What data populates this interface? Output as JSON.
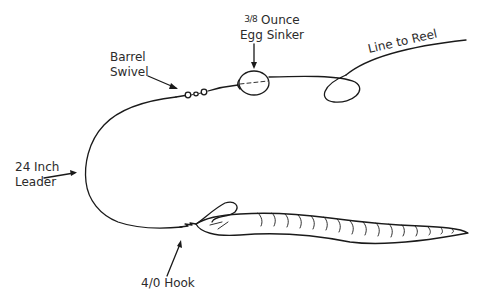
{
  "diagram": {
    "colors": {
      "line": "#1a1a1a",
      "text": "#2b2b2b",
      "background": "#ffffff"
    },
    "labels": {
      "sinker": {
        "line1_fraction": "3/8",
        "line1_text": " Ounce",
        "line2": "Egg Sinker"
      },
      "swivel": {
        "line1": "Barrel",
        "line2": "Swivel"
      },
      "line_to_reel": {
        "text": "Line to Reel"
      },
      "leader": {
        "line1": "24 Inch",
        "line2": "Leader"
      },
      "hook": {
        "text": "4/0 Hook"
      }
    },
    "components": [
      {
        "name": "egg-sinker",
        "label": "3/8 Ounce Egg Sinker"
      },
      {
        "name": "barrel-swivel",
        "label": "Barrel Swivel"
      },
      {
        "name": "line-to-reel",
        "label": "Line to Reel"
      },
      {
        "name": "leader",
        "label": "24 Inch Leader"
      },
      {
        "name": "hook",
        "label": "4/0 Hook"
      },
      {
        "name": "bait-worm",
        "label": ""
      }
    ]
  }
}
